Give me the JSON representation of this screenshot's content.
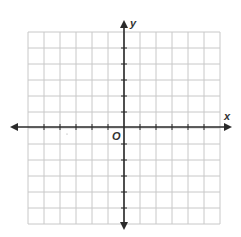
{
  "diagram": {
    "type": "coordinate-plane",
    "grid": {
      "columns": 12,
      "rows": 12,
      "left": 28,
      "top": 32,
      "cell_size": 16,
      "line_color": "#c8c8c8"
    },
    "axes": {
      "color": "#2a2a2a",
      "origin_px": {
        "x": 124,
        "y": 127
      },
      "x_extent": {
        "from": 10,
        "to": 232
      },
      "y_extent": {
        "from": 20,
        "to": 230
      },
      "x_label": "x",
      "y_label": "y",
      "origin_label": "O",
      "x_range": [
        -6,
        6
      ],
      "y_range": [
        -6,
        6
      ],
      "tick_marks": true,
      "tick_numbers": false
    }
  }
}
